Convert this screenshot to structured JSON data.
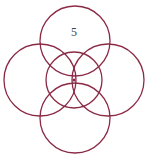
{
  "diagram": {
    "label": "5",
    "stroke_color": "#8b2a45",
    "circles": [
      {
        "name": "top",
        "cx": 75,
        "cy": 41,
        "r": 35
      },
      {
        "name": "left",
        "cx": 40,
        "cy": 80,
        "r": 36
      },
      {
        "name": "right",
        "cx": 108,
        "cy": 80,
        "r": 36
      },
      {
        "name": "bottom",
        "cx": 75,
        "cy": 118,
        "r": 35
      },
      {
        "name": "center",
        "cx": 74,
        "cy": 80,
        "r": 28
      }
    ]
  }
}
